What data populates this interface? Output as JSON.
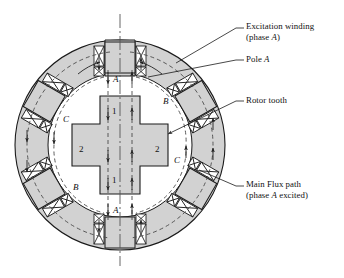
{
  "figure": {
    "type": "switched-reluctance-motor-cross-section",
    "background_color": "#ffffff",
    "iron_fill_color": "#d2d2d2",
    "line_color": "#1a1a1a",
    "flux_line_color": "#555555"
  },
  "callouts": {
    "excitation_winding": {
      "line1": "Excitation winding",
      "line2_pre": "(phase ",
      "line2_italic": "A",
      "line2_post": ")"
    },
    "pole_a": {
      "text_pre": "Pole ",
      "text_italic": "A"
    },
    "rotor_tooth": {
      "text": "Rotor tooth"
    },
    "main_flux_path": {
      "line1": "Main Flux path",
      "line2_pre": "(phase ",
      "line2_italic": "A",
      "line2_post": " excited)"
    }
  },
  "pole_labels": {
    "top_a": "A",
    "bottom_a": "A",
    "upper_right_b": "B",
    "lower_left_b": "B",
    "left_c": "C",
    "right_c": "C"
  },
  "rotor_labels": {
    "top_tooth": "1",
    "bottom_tooth": "1",
    "left_tooth": "2",
    "right_tooth": "2"
  }
}
